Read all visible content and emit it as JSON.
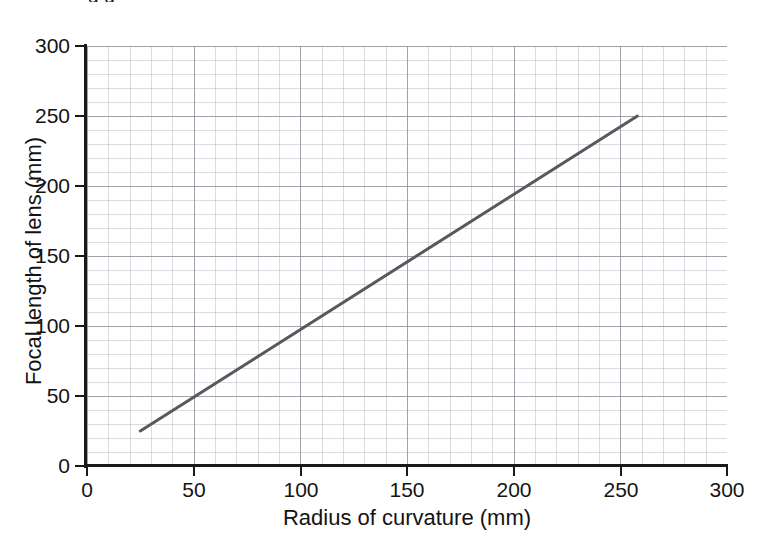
{
  "page": {
    "clipped_caption": "g    g",
    "background_color": "#ffffff"
  },
  "chart_data": {
    "type": "line",
    "title": "",
    "subtitle": "",
    "xlabel": "Radius of curvature (mm)",
    "ylabel": "Focal length of lens (mm)",
    "xlim": [
      0,
      300
    ],
    "ylim": [
      0,
      300
    ],
    "xticks": [
      0,
      50,
      100,
      150,
      200,
      250,
      300
    ],
    "yticks": [
      0,
      50,
      100,
      150,
      200,
      250,
      300
    ],
    "xtick_labels": [
      "0",
      "50",
      "100",
      "150",
      "200",
      "250",
      "300"
    ],
    "ytick_labels": [
      "0",
      "50",
      "100",
      "150",
      "200",
      "250",
      "300"
    ],
    "x_minor_step": 10,
    "y_minor_step": 10,
    "grid": true,
    "grid_minor": true,
    "legend": false,
    "legend_position": "none",
    "series": [
      {
        "name": "best-fit line",
        "type": "line",
        "color": "#58585d",
        "line_width": 3,
        "markers": false,
        "x": [
          25,
          258
        ],
        "y": [
          25,
          250
        ],
        "annotation": "straight line of best fit through origin, slope ≈ 0.97"
      }
    ]
  },
  "axes": {
    "x_axis_name": "x-axis",
    "y_axis_name": "y-axis",
    "axis_color": "#1a1a1a",
    "grid_major_color": "#9696a0",
    "grid_minor_color": "#afafb9"
  }
}
